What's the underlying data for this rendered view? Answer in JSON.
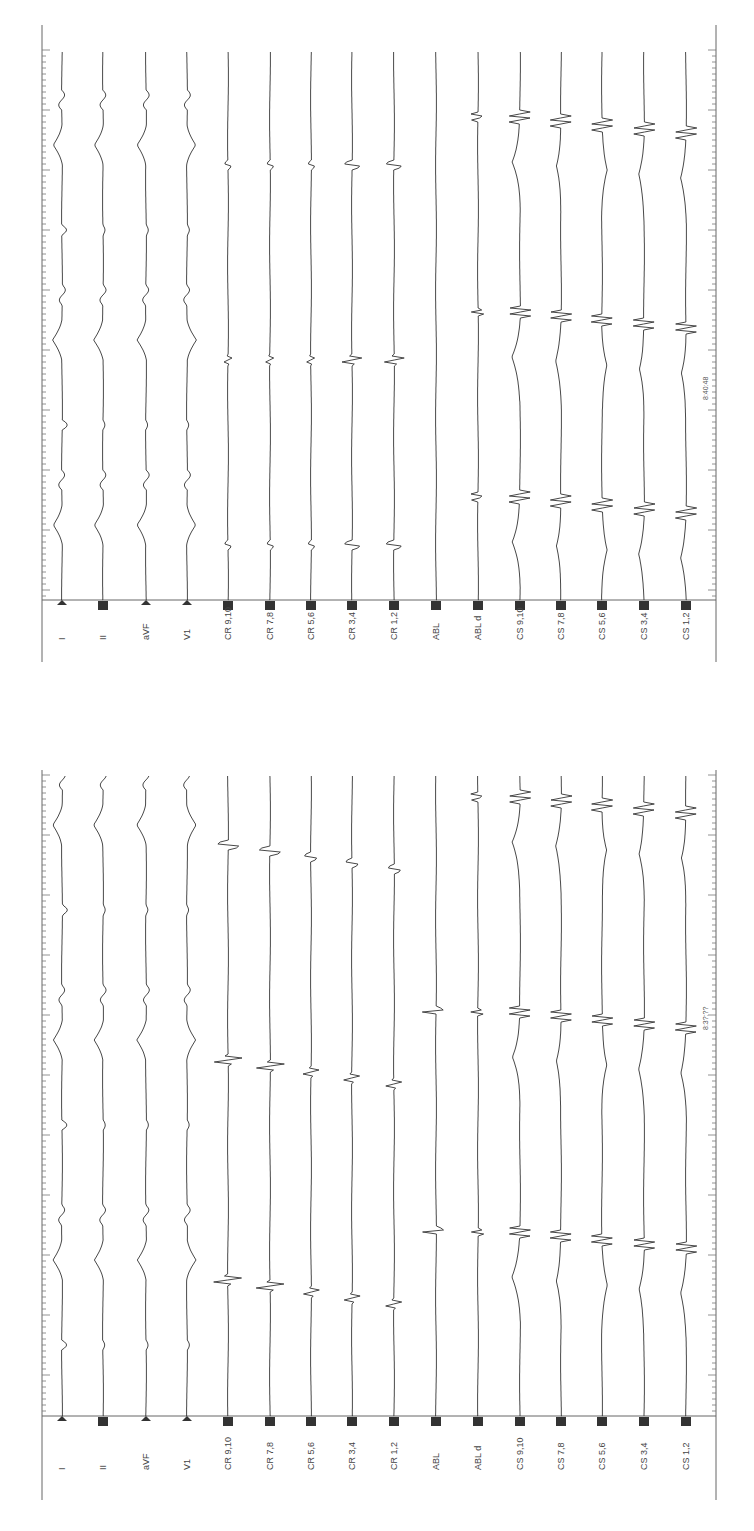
{
  "chart_data": [
    {
      "type": "line",
      "title": "",
      "panel": "bottom",
      "orientation": "rotated-90",
      "channels": [
        "I",
        "II",
        "aVF",
        "V1",
        "CR 9,10",
        "CR 7,8",
        "CR 5,6",
        "CR 3,4",
        "CR 1,2",
        "ABL",
        "ABL d",
        "CS 9,10",
        "CS 7,8",
        "CS 5,6",
        "CS 3,4",
        "CS 1,2"
      ],
      "channel_markers": [
        "triangle",
        "square",
        "triangle",
        "triangle",
        "square",
        "square",
        "square",
        "square",
        "square",
        "square",
        "square",
        "square",
        "square",
        "square",
        "square",
        "square"
      ],
      "beats": 3,
      "timestamp_text": "8:3?:??",
      "xlabel": "",
      "ylabel": ""
    },
    {
      "type": "line",
      "title": "",
      "panel": "top",
      "orientation": "rotated-90",
      "channels": [
        "I",
        "II",
        "aVF",
        "V1",
        "CR 9,10",
        "CR 7,8",
        "CR 5,6",
        "CR 3,4",
        "CR 1,2",
        "ABL",
        "ABL d",
        "CS 9,10",
        "CS 7,8",
        "CS 5,6",
        "CS 3,4",
        "CS 1,2"
      ],
      "channel_markers": [
        "triangle",
        "square",
        "triangle",
        "triangle",
        "square",
        "square",
        "square",
        "square",
        "square",
        "square",
        "square",
        "square",
        "square",
        "square",
        "square",
        "square"
      ],
      "beats": 3,
      "timestamp_text": "8:40:48",
      "xlabel": "",
      "ylabel": ""
    }
  ]
}
